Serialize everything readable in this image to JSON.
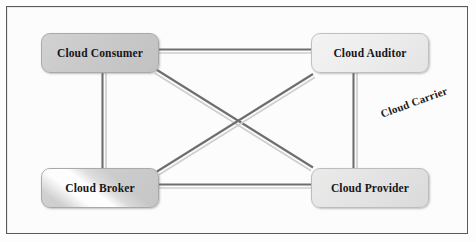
{
  "diagram": {
    "frame": {
      "border_color": "#5a5a5a",
      "background": "#fcfcfc"
    },
    "nodes": [
      {
        "id": "cloud-consumer",
        "label": "Cloud Consumer",
        "fill": "#c9c9c9",
        "border_color": "#a9a9a9",
        "x": 41,
        "y": 33,
        "width": 118,
        "height": 40
      },
      {
        "id": "cloud-auditor",
        "label": "Cloud Auditor",
        "fill": "#ededed",
        "border_color": "#c0c0c0",
        "x": 311,
        "y": 33,
        "width": 118,
        "height": 40
      },
      {
        "id": "cloud-broker",
        "label": "Cloud Broker",
        "fill": "#cdcdcd",
        "border_color": "#a9a9a9",
        "x": 41,
        "y": 168,
        "width": 118,
        "height": 40
      },
      {
        "id": "cloud-provider",
        "label": "Cloud Provider",
        "fill": "#e3e3e3",
        "border_color": "#bdbdbd",
        "x": 311,
        "y": 168,
        "width": 118,
        "height": 40
      }
    ],
    "floating_labels": [
      {
        "id": "cloud-carrier",
        "label": "Cloud Carrier",
        "rotation_deg": -20,
        "x": 381,
        "y": 108
      }
    ],
    "connectors": [
      {
        "id": "consumer-auditor",
        "from": "cloud-consumer",
        "to": "cloud-auditor",
        "x1": 159,
        "y1": 51,
        "x2": 311,
        "y2": 51,
        "style": "double-tube"
      },
      {
        "id": "consumer-broker",
        "from": "cloud-consumer",
        "to": "cloud-broker",
        "x1": 104,
        "y1": 73,
        "x2": 104,
        "y2": 168,
        "style": "double-tube"
      },
      {
        "id": "auditor-provider",
        "from": "cloud-auditor",
        "to": "cloud-provider",
        "x1": 355,
        "y1": 73,
        "x2": 355,
        "y2": 168,
        "style": "double-tube"
      },
      {
        "id": "broker-provider",
        "from": "cloud-broker",
        "to": "cloud-provider",
        "x1": 159,
        "y1": 186,
        "x2": 311,
        "y2": 186,
        "style": "double-tube"
      },
      {
        "id": "consumer-provider",
        "from": "cloud-consumer",
        "to": "cloud-provider",
        "x1": 159,
        "y1": 72,
        "x2": 311,
        "y2": 169,
        "style": "double-tube"
      },
      {
        "id": "broker-auditor",
        "from": "cloud-broker",
        "to": "cloud-auditor",
        "x1": 159,
        "y1": 169,
        "x2": 311,
        "y2": 72,
        "style": "double-tube"
      }
    ],
    "connector_colors": {
      "core": "#6e6e6e",
      "highlight": "#cfcfcf"
    }
  }
}
